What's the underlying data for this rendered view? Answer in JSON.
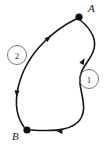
{
  "figure": {
    "type": "oriented-curve-diagram",
    "background_color": "#ffffff",
    "curve_color": "#151515",
    "label_color": "#1a1a1a",
    "circle_label_color": "#6a6a6a",
    "width": 110,
    "height": 146
  },
  "points": [
    {
      "id": "A",
      "label": "A",
      "x": 79,
      "y": 17,
      "label_x": 88,
      "label_y": 12,
      "radius": 3.6
    },
    {
      "id": "B",
      "label": "B",
      "x": 27,
      "y": 130,
      "label_x": 12,
      "label_y": 140,
      "radius": 3.6
    }
  ],
  "paths": [
    {
      "id": "path-1",
      "label": "1",
      "circle_label_x": 89,
      "circle_label_y": 79,
      "circle_label_r": 9.5,
      "from": "A",
      "to": "B",
      "d": "M 79 19 C 90 28 98 40 93 52 C 88 64 78 70 80 84 C 82 98 88 112 78 122 C 68 132 46 131 31 130",
      "side": "right"
    },
    {
      "id": "path-2",
      "label": "2",
      "circle_label_x": 17,
      "circle_label_y": 55,
      "circle_label_r": 9.5,
      "from": "B",
      "to": "A",
      "d": "M 76 19 C 66 24 54 32 44 42 C 32 54 22 70 18 88 C 15 102 16 116 24 127",
      "side": "left"
    }
  ],
  "arrows": [
    {
      "id": "arrow-upper-left",
      "on_path": "path-2",
      "x": 51,
      "y": 36,
      "angle_deg": -39,
      "direction": "toward-A",
      "size": 6.5
    },
    {
      "id": "arrow-lower-left",
      "on_path": "path-2",
      "x": 16.5,
      "y": 97,
      "angle_deg": 95,
      "direction": "toward-B",
      "size": 6.5
    },
    {
      "id": "arrow-right",
      "on_path": "path-1",
      "x": 84.5,
      "y": 58,
      "angle_deg": -64,
      "direction": "upward",
      "size": 6.5
    },
    {
      "id": "arrow-bottom",
      "on_path": "path-1",
      "x": 56,
      "y": 131,
      "angle_deg": 184,
      "direction": "toward-B",
      "size": 6.5
    }
  ]
}
